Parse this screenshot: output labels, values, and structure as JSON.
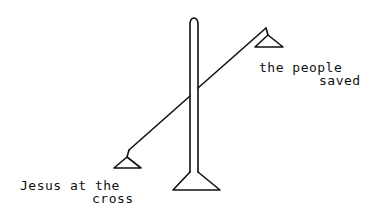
{
  "diagram": {
    "stroke_color": "#111111",
    "background": "#ffffff",
    "labels": {
      "left_pan": {
        "line1": "Jesus at the",
        "line2": "cross"
      },
      "right_pan": {
        "line1": "the people",
        "line2": "saved"
      }
    }
  }
}
